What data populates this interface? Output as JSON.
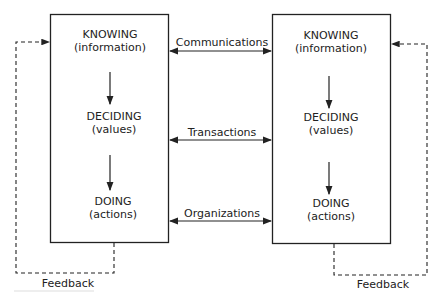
{
  "left_box": {
    "stages": [
      {
        "title": "KNOWING",
        "sub": "(information)"
      },
      {
        "title": "DECIDING",
        "sub": "(values)"
      },
      {
        "title": "DOING",
        "sub": "(actions)"
      }
    ]
  },
  "right_box": {
    "stages": [
      {
        "title": "KNOWING",
        "sub": "(information)"
      },
      {
        "title": "DECIDING",
        "sub": "(values)"
      },
      {
        "title": "DOING",
        "sub": "(actions)"
      }
    ]
  },
  "links": {
    "communications": "Communications",
    "transactions": "Transactions",
    "organizations": "Organizations"
  },
  "feedback": {
    "left": "Feedback",
    "right": "Feedback"
  },
  "colors": {
    "line": "#222222",
    "background": "#ffffff"
  }
}
